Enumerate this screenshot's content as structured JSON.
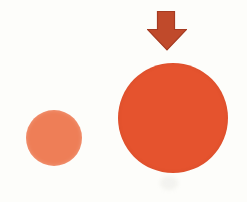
{
  "figure": {
    "background_color": "#fdfdfa",
    "arrow": {
      "icon": "down-arrow-icon",
      "fill": "#c04a2b",
      "outline": "#a53b22"
    },
    "circles": {
      "small": {
        "name": "small-circle",
        "color": "#ee7e57"
      },
      "large": {
        "name": "large-circle",
        "color": "#e5532e"
      }
    }
  }
}
